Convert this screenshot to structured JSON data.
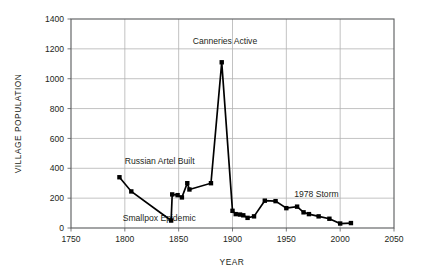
{
  "chart_data": {
    "type": "line",
    "title": "",
    "xlabel": "YEAR",
    "ylabel": "VILLAGE POPULATION",
    "xlim": [
      1750,
      2050
    ],
    "ylim": [
      0,
      1400
    ],
    "xticks": [
      1750,
      1800,
      1850,
      1900,
      1950,
      2000,
      2050
    ],
    "yticks": [
      0,
      200,
      400,
      600,
      800,
      1000,
      1200,
      1400
    ],
    "grid": true,
    "legend": "none",
    "marker": "filled-square",
    "line_color": "#000000",
    "grid_color": "#b3b3b3",
    "series": [
      {
        "name": "Village Population",
        "points": [
          [
            1795,
            340
          ],
          [
            1806,
            245
          ],
          [
            1843,
            50
          ],
          [
            1844,
            225
          ],
          [
            1849,
            220
          ],
          [
            1853,
            205
          ],
          [
            1858,
            300
          ],
          [
            1860,
            258
          ],
          [
            1880,
            300
          ],
          [
            1890,
            1110
          ],
          [
            1900,
            115
          ],
          [
            1903,
            93
          ],
          [
            1907,
            90
          ],
          [
            1910,
            85
          ],
          [
            1914,
            68
          ],
          [
            1920,
            78
          ],
          [
            1930,
            183
          ],
          [
            1940,
            180
          ],
          [
            1950,
            133
          ],
          [
            1960,
            143
          ],
          [
            1966,
            105
          ],
          [
            1971,
            93
          ],
          [
            1980,
            78
          ],
          [
            1990,
            62
          ],
          [
            2000,
            30
          ],
          [
            2010,
            33
          ]
        ]
      }
    ],
    "annotations": [
      {
        "id": "russian-artel-built",
        "text": "Russian Artel Built",
        "x": 1800,
        "y": 430,
        "align": "start"
      },
      {
        "id": "smallpox-epidemic",
        "text": "Smallpox Epidemic",
        "x": 1798,
        "y": 45,
        "align": "start"
      },
      {
        "id": "canneries-active",
        "text": "Canneries Active",
        "x": 1893,
        "y": 1235,
        "align": "mid"
      },
      {
        "id": "1978-storm",
        "text": "1978 Storm",
        "x": 1978,
        "y": 205,
        "align": "mid"
      }
    ]
  },
  "axes": {
    "y_tick_labels": [
      "0",
      "200",
      "400",
      "600",
      "800",
      "1000",
      "1200",
      "1400"
    ],
    "x_tick_labels": [
      "1750",
      "1800",
      "1850",
      "1900",
      "1950",
      "2000",
      "2050"
    ],
    "x_title": "YEAR",
    "y_title": "VILLAGE POPULATION"
  }
}
